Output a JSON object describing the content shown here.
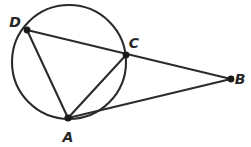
{
  "figure": {
    "canvas": {
      "width": 251,
      "height": 147,
      "background": "#ffffff"
    },
    "stroke_color": "#2b2b2b",
    "point_color": "#1a1a1a",
    "label_color": "#262626",
    "circle": {
      "cx": 69,
      "cy": 62,
      "r": 57,
      "stroke_width": 2.1
    },
    "points": [
      {
        "id": "D",
        "label": "D",
        "x": 27,
        "y": 30,
        "r": 3.4,
        "label_x": 15,
        "label_y": 27,
        "on_circle": true
      },
      {
        "id": "C",
        "label": "C",
        "x": 126,
        "y": 55,
        "r": 3.4,
        "label_x": 134,
        "label_y": 48,
        "on_circle": true
      },
      {
        "id": "B",
        "label": "B",
        "x": 231,
        "y": 79,
        "r": 3.4,
        "label_x": 240,
        "label_y": 84,
        "on_circle": false
      },
      {
        "id": "A",
        "label": "A",
        "x": 68,
        "y": 118,
        "r": 3.6,
        "label_x": 68,
        "label_y": 142,
        "on_circle": true
      }
    ],
    "segments": [
      {
        "id": "DB",
        "from": "D",
        "to": "B",
        "x1": 27,
        "y1": 30,
        "x2": 231,
        "y2": 79,
        "stroke_width": 2.1
      },
      {
        "id": "AB",
        "from": "A",
        "to": "B",
        "x1": 68,
        "y1": 118,
        "x2": 231,
        "y2": 79,
        "stroke_width": 2.1
      },
      {
        "id": "DA",
        "from": "D",
        "to": "A",
        "x1": 27,
        "y1": 30,
        "x2": 68,
        "y2": 118,
        "stroke_width": 2.1
      },
      {
        "id": "AC",
        "from": "A",
        "to": "C",
        "x1": 68,
        "y1": 118,
        "x2": 126,
        "y2": 55,
        "stroke_width": 2.1
      }
    ]
  }
}
